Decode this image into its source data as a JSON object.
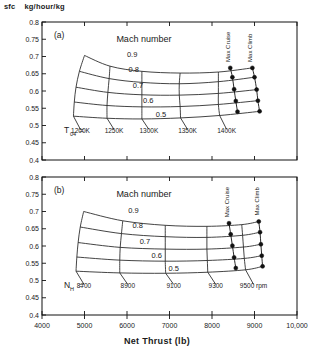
{
  "figure": {
    "y_axis_caption_symbol": "sfc",
    "y_axis_caption_units": "kg/hour/kg",
    "x_axis_label": "Net Thrust (lb)"
  },
  "chart_data": {
    "type": "line",
    "title": "",
    "xlabel": "Net Thrust (lb)",
    "ylabel": "sfc  kg/hour/kg",
    "xlim": [
      4000,
      10000
    ],
    "ylim": [
      0.4,
      0.8
    ],
    "grid": false,
    "legend_position": "inline-annotations",
    "xticks": [
      4000,
      5000,
      6000,
      7000,
      8000,
      9000,
      10000
    ],
    "xticklabels": [
      "4000",
      "5000",
      "6000",
      "7000",
      "8000",
      "9000",
      "10,000"
    ],
    "yticks": [
      0.4,
      0.45,
      0.5,
      0.55,
      0.6,
      0.65,
      0.7,
      0.75,
      0.8
    ],
    "yticklabels": [
      "0.4",
      "0.45",
      "0.5",
      "0.55",
      "0.6",
      "0.65",
      "0.7",
      "0.75",
      "0.8"
    ],
    "panels": [
      {
        "id": "a",
        "panel_label": "(a)",
        "family_title": "Mach number",
        "family_values": [
          "0.9",
          "0.8",
          "0.7",
          "0.6",
          "0.5"
        ],
        "parameter_symbol": "T",
        "parameter_subscript": "04",
        "parameter_equals": "=",
        "parameter_values": [
          "1200K",
          "1250K",
          "1300K",
          "1350K",
          "1400K"
        ],
        "operating_lines": [
          "Max Cruise",
          "Max Climb"
        ],
        "mach_curves": [
          {
            "mach": "0.9",
            "points": [
              [
                5000,
                0.703
              ],
              [
                5600,
                0.672
              ],
              [
                6350,
                0.657
              ],
              [
                7250,
                0.652
              ],
              [
                8150,
                0.655
              ],
              [
                8950,
                0.667
              ]
            ]
          },
          {
            "mach": "0.8",
            "points": [
              [
                4880,
                0.657
              ],
              [
                5580,
                0.636
              ],
              [
                6350,
                0.625
              ],
              [
                7230,
                0.621
              ],
              [
                8150,
                0.627
              ],
              [
                9000,
                0.64
              ]
            ]
          },
          {
            "mach": "0.7",
            "points": [
              [
                4800,
                0.611
              ],
              [
                5550,
                0.596
              ],
              [
                6350,
                0.589
              ],
              [
                7230,
                0.588
              ],
              [
                8150,
                0.593
              ],
              [
                9050,
                0.604
              ]
            ]
          },
          {
            "mach": "0.6",
            "points": [
              [
                4760,
                0.568
              ],
              [
                5530,
                0.558
              ],
              [
                6350,
                0.554
              ],
              [
                7250,
                0.555
              ],
              [
                8150,
                0.561
              ],
              [
                9080,
                0.572
              ]
            ]
          },
          {
            "mach": "0.5",
            "points": [
              [
                4740,
                0.527
              ],
              [
                5530,
                0.521
              ],
              [
                6350,
                0.519
              ],
              [
                7260,
                0.522
              ],
              [
                8180,
                0.529
              ],
              [
                9120,
                0.541
              ]
            ]
          }
        ],
        "temperature_curves": [
          {
            "label": "1200K",
            "points": [
              [
                5000,
                0.703
              ],
              [
                4880,
                0.657
              ],
              [
                4800,
                0.611
              ],
              [
                4760,
                0.568
              ],
              [
                4740,
                0.527
              ]
            ]
          },
          {
            "label": "1250K",
            "points": [
              [
                5600,
                0.672
              ],
              [
                5580,
                0.636
              ],
              [
                5550,
                0.596
              ],
              [
                5530,
                0.558
              ],
              [
                5530,
                0.521
              ]
            ]
          },
          {
            "label": "1300K",
            "points": [
              [
                6350,
                0.657
              ],
              [
                6350,
                0.625
              ],
              [
                6350,
                0.589
              ],
              [
                6350,
                0.554
              ],
              [
                6350,
                0.519
              ]
            ]
          },
          {
            "label": "1350K",
            "points": [
              [
                7250,
                0.652
              ],
              [
                7230,
                0.621
              ],
              [
                7230,
                0.588
              ],
              [
                7250,
                0.555
              ],
              [
                7260,
                0.522
              ]
            ]
          },
          {
            "label": "1400K",
            "points": [
              [
                8150,
                0.655
              ],
              [
                8150,
                0.627
              ],
              [
                8150,
                0.593
              ],
              [
                8150,
                0.561
              ],
              [
                8180,
                0.529
              ]
            ]
          }
        ],
        "operating_line_data": [
          {
            "name": "Max Cruise",
            "points": [
              [
                8430,
                0.667
              ],
              [
                8480,
                0.64
              ],
              [
                8520,
                0.605
              ],
              [
                8560,
                0.571
              ],
              [
                8600,
                0.54
              ]
            ]
          },
          {
            "name": "Max Climb",
            "points": [
              [
                8950,
                0.667
              ],
              [
                9000,
                0.64
              ],
              [
                9050,
                0.604
              ],
              [
                9080,
                0.572
              ],
              [
                9120,
                0.541
              ]
            ]
          }
        ]
      },
      {
        "id": "b",
        "panel_label": "(b)",
        "family_title": "Mach number",
        "family_values": [
          "0.9",
          "0.8",
          "0.7",
          "0.6",
          "0.5"
        ],
        "parameter_symbol": "N",
        "parameter_subscript": "H",
        "parameter_equals": "=",
        "parameter_values": [
          "8700",
          "8900",
          "9100",
          "9300",
          "9500 rpm"
        ],
        "operating_lines": [
          "Max Cruise",
          "Max Climb"
        ],
        "mach_curves": [
          {
            "mach": "0.9",
            "points": [
              [
                4980,
                0.7
              ],
              [
                5900,
                0.673
              ],
              [
                6900,
                0.66
              ],
              [
                7880,
                0.657
              ],
              [
                8700,
                0.662
              ],
              [
                9100,
                0.671
              ]
            ]
          },
          {
            "mach": "0.8",
            "points": [
              [
                4900,
                0.655
              ],
              [
                5870,
                0.636
              ],
              [
                6900,
                0.627
              ],
              [
                7880,
                0.625
              ],
              [
                8720,
                0.631
              ],
              [
                9130,
                0.64
              ]
            ]
          },
          {
            "mach": "0.7",
            "points": [
              [
                4850,
                0.61
              ],
              [
                5840,
                0.596
              ],
              [
                6900,
                0.591
              ],
              [
                7880,
                0.591
              ],
              [
                8740,
                0.597
              ],
              [
                9150,
                0.605
              ]
            ]
          },
          {
            "mach": "0.6",
            "points": [
              [
                4820,
                0.568
              ],
              [
                5830,
                0.559
              ],
              [
                6900,
                0.556
              ],
              [
                7890,
                0.558
              ],
              [
                8760,
                0.564
              ],
              [
                9170,
                0.572
              ]
            ]
          },
          {
            "mach": "0.5",
            "points": [
              [
                4800,
                0.527
              ],
              [
                5830,
                0.522
              ],
              [
                6910,
                0.521
              ],
              [
                7900,
                0.524
              ],
              [
                8790,
                0.531
              ],
              [
                9190,
                0.541
              ]
            ]
          }
        ],
        "speed_curves": [
          {
            "label": "8700",
            "points": [
              [
                4980,
                0.7
              ],
              [
                4900,
                0.655
              ],
              [
                4850,
                0.61
              ],
              [
                4820,
                0.568
              ],
              [
                4800,
                0.527
              ]
            ]
          },
          {
            "label": "8900",
            "points": [
              [
                5900,
                0.673
              ],
              [
                5870,
                0.636
              ],
              [
                5840,
                0.596
              ],
              [
                5830,
                0.559
              ],
              [
                5830,
                0.522
              ]
            ]
          },
          {
            "label": "9100",
            "points": [
              [
                6900,
                0.66
              ],
              [
                6900,
                0.627
              ],
              [
                6900,
                0.591
              ],
              [
                6900,
                0.556
              ],
              [
                6910,
                0.521
              ]
            ]
          },
          {
            "label": "9300",
            "points": [
              [
                7880,
                0.657
              ],
              [
                7880,
                0.625
              ],
              [
                7880,
                0.591
              ],
              [
                7890,
                0.558
              ],
              [
                7900,
                0.524
              ]
            ]
          },
          {
            "label": "9500 rpm",
            "points": [
              [
                8700,
                0.662
              ],
              [
                8720,
                0.631
              ],
              [
                8740,
                0.597
              ],
              [
                8760,
                0.564
              ],
              [
                8790,
                0.531
              ]
            ]
          }
        ],
        "operating_line_data": [
          {
            "name": "Max Cruise",
            "points": [
              [
                8400,
                0.666
              ],
              [
                8440,
                0.634
              ],
              [
                8480,
                0.601
              ],
              [
                8520,
                0.567
              ],
              [
                8560,
                0.536
              ]
            ]
          },
          {
            "name": "Max Climb",
            "points": [
              [
                9100,
                0.671
              ],
              [
                9130,
                0.64
              ],
              [
                9150,
                0.605
              ],
              [
                9170,
                0.572
              ],
              [
                9190,
                0.541
              ]
            ]
          }
        ]
      }
    ]
  }
}
